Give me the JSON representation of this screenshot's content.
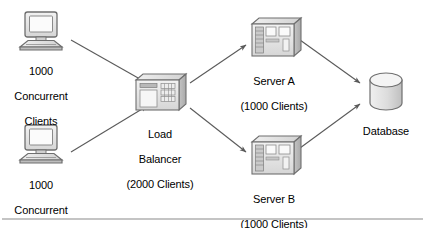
{
  "diagram": {
    "colors": {
      "stroke": "#6b6b6b",
      "arrow": "#5a5a5a",
      "fill_light": "#e8e8e8",
      "fill_mid": "#d0d0d0",
      "fill_dark": "#b4b4b4",
      "text": "#000000",
      "rule": "#8a8a8a",
      "background": "#ffffff"
    },
    "nodes": [
      {
        "id": "client-top",
        "icon": "desktop-computer-icon",
        "label_lines": [
          "1000",
          "Concurrent",
          "Clients"
        ]
      },
      {
        "id": "client-bottom",
        "icon": "desktop-computer-icon",
        "label_lines": [
          "1000",
          "Concurrent",
          "Clients"
        ]
      },
      {
        "id": "load-balancer",
        "icon": "server-box-icon",
        "label_lines": [
          "Load",
          "Balancer",
          "(2000 Clients)"
        ]
      },
      {
        "id": "server-a",
        "icon": "server-box-icon",
        "label_lines": [
          "Server A",
          "(1000 Clients)"
        ]
      },
      {
        "id": "server-b",
        "icon": "server-box-icon",
        "label_lines": [
          "Server B",
          "(1000 Clients)"
        ]
      },
      {
        "id": "database",
        "icon": "database-cylinder-icon",
        "label_lines": [
          "Database"
        ]
      }
    ],
    "connections": [
      {
        "from": "client-top",
        "to": "load-balancer"
      },
      {
        "from": "client-bottom",
        "to": "load-balancer"
      },
      {
        "from": "load-balancer",
        "to": "server-a"
      },
      {
        "from": "load-balancer",
        "to": "server-b"
      },
      {
        "from": "server-a",
        "to": "database"
      },
      {
        "from": "server-b",
        "to": "database"
      }
    ],
    "labels": {
      "client_top_l1": "1000",
      "client_top_l2": "Concurrent",
      "client_top_l3": "Clients",
      "client_bottom_l1": "1000",
      "client_bottom_l2": "Concurrent",
      "client_bottom_l3": "Clients",
      "load_balancer_l1": "Load",
      "load_balancer_l2": "Balancer",
      "load_balancer_l3": "(2000 Clients)",
      "server_a_l1": "Server A",
      "server_a_l2": "(1000 Clients)",
      "server_b_l1": "Server B",
      "server_b_l2": "(1000 Clients)",
      "database_l1": "Database"
    }
  }
}
